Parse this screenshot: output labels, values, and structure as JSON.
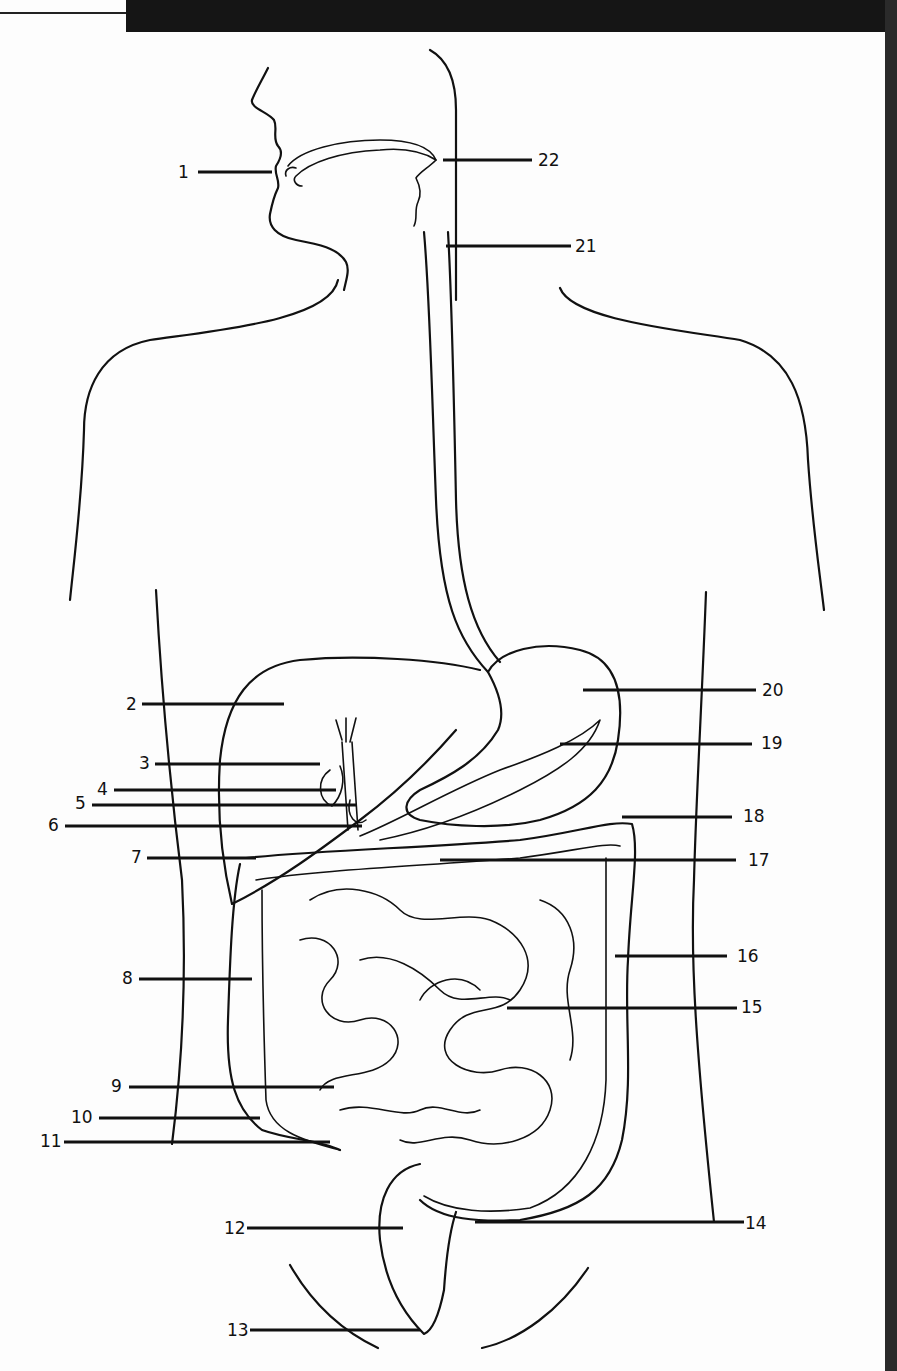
{
  "diagram": {
    "labels": [
      {
        "n": "1",
        "x": 178,
        "y": 178,
        "lx1": 198,
        "lx2": 272,
        "ly": 172,
        "side": "left"
      },
      {
        "n": "2",
        "x": 126,
        "y": 710,
        "lx1": 142,
        "lx2": 284,
        "ly": 704,
        "side": "left"
      },
      {
        "n": "3",
        "x": 139,
        "y": 769,
        "lx1": 155,
        "lx2": 320,
        "ly": 764,
        "side": "left"
      },
      {
        "n": "4",
        "x": 97,
        "y": 795,
        "lx1": 114,
        "lx2": 336,
        "ly": 790,
        "side": "left"
      },
      {
        "n": "5",
        "x": 75,
        "y": 809,
        "lx1": 92,
        "lx2": 356,
        "ly": 805,
        "side": "left"
      },
      {
        "n": "6",
        "x": 48,
        "y": 831,
        "lx1": 65,
        "lx2": 362,
        "ly": 826,
        "side": "left"
      },
      {
        "n": "7",
        "x": 131,
        "y": 863,
        "lx1": 147,
        "lx2": 256,
        "ly": 858,
        "side": "left"
      },
      {
        "n": "8",
        "x": 122,
        "y": 984,
        "lx1": 139,
        "lx2": 252,
        "ly": 979,
        "side": "left"
      },
      {
        "n": "9",
        "x": 111,
        "y": 1092,
        "lx1": 129,
        "lx2": 334,
        "ly": 1087,
        "side": "left"
      },
      {
        "n": "10",
        "x": 71,
        "y": 1123,
        "lx1": 99,
        "lx2": 260,
        "ly": 1118,
        "side": "left"
      },
      {
        "n": "11",
        "x": 40,
        "y": 1147,
        "lx1": 64,
        "lx2": 330,
        "ly": 1142,
        "side": "left"
      },
      {
        "n": "12",
        "x": 224,
        "y": 1234,
        "lx1": 247,
        "lx2": 403,
        "ly": 1228,
        "side": "left"
      },
      {
        "n": "13",
        "x": 227,
        "y": 1336,
        "lx1": 250,
        "lx2": 420,
        "ly": 1330,
        "side": "left"
      },
      {
        "n": "14",
        "x": 745,
        "y": 1229,
        "lx1": 475,
        "lx2": 744,
        "ly": 1222,
        "side": "right"
      },
      {
        "n": "15",
        "x": 741,
        "y": 1013,
        "lx1": 507,
        "lx2": 737,
        "ly": 1008,
        "side": "right"
      },
      {
        "n": "16",
        "x": 737,
        "y": 962,
        "lx1": 615,
        "lx2": 727,
        "ly": 956,
        "side": "right"
      },
      {
        "n": "17",
        "x": 748,
        "y": 866,
        "lx1": 440,
        "lx2": 736,
        "ly": 860,
        "side": "right"
      },
      {
        "n": "18",
        "x": 743,
        "y": 822,
        "lx1": 622,
        "lx2": 732,
        "ly": 817,
        "side": "right"
      },
      {
        "n": "19",
        "x": 761,
        "y": 749,
        "lx1": 560,
        "lx2": 752,
        "ly": 744,
        "side": "right"
      },
      {
        "n": "20",
        "x": 762,
        "y": 696,
        "lx1": 583,
        "lx2": 756,
        "ly": 690,
        "side": "right"
      },
      {
        "n": "21",
        "x": 575,
        "y": 252,
        "lx1": 446,
        "lx2": 571,
        "ly": 246,
        "side": "right"
      },
      {
        "n": "22",
        "x": 538,
        "y": 166,
        "lx1": 443,
        "lx2": 532,
        "ly": 160,
        "side": "right"
      }
    ]
  }
}
